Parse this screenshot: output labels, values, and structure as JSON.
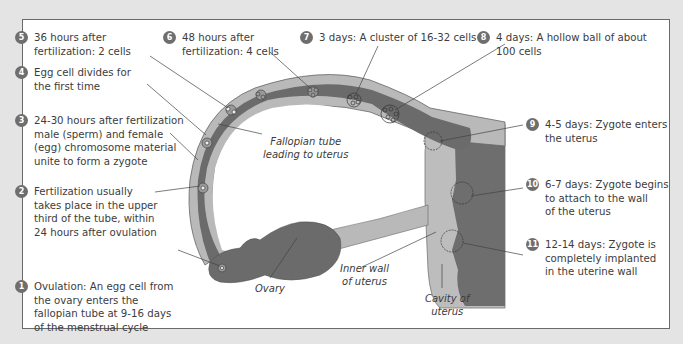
{
  "diagram": {
    "colors": {
      "background": "#e4e4e4",
      "panel": "#ffffff",
      "tube_outer": "#b9b9b9",
      "tube_inner": "#6b6b6b",
      "uterus_wall": "#bdbdbd",
      "uterus_cavity": "#6e6e6e",
      "badge": "#6e6e6e"
    },
    "steps": [
      {
        "num": "1",
        "text": "Ovulation: An egg cell from\nthe ovary enters the\nfallopian tube at 9-16 days\nof the menstrual cycle"
      },
      {
        "num": "2",
        "text": "Fertilization usually\ntakes place in the upper\nthird of the tube, within\n24 hours after ovulation"
      },
      {
        "num": "3",
        "text": "24-30 hours after fertilization\nmale (sperm) and female\n(egg) chromosome material\nunite to form a zygote"
      },
      {
        "num": "4",
        "text": "Egg cell divides for\nthe first time"
      },
      {
        "num": "5",
        "text": "36 hours after\nfertilization: 2 cells"
      },
      {
        "num": "6",
        "text": "48 hours after\nfertilization: 4 cells"
      },
      {
        "num": "7",
        "text": "3 days: A cluster of 16-32 cells"
      },
      {
        "num": "8",
        "text": "4 days: A hollow ball of about\n100 cells"
      },
      {
        "num": "9",
        "text": "4-5 days: Zygote enters\nthe uterus"
      },
      {
        "num": "10",
        "text": "6-7 days: Zygote begins\nto attach to the wall\nof the uterus"
      },
      {
        "num": "11",
        "text": "12-14 days: Zygote is\ncompletely implanted\nin the uterine wall"
      }
    ],
    "labels": {
      "fallopian": "Fallopian tube\nleading to uterus",
      "ovary": "Ovary",
      "inner_wall": "Inner wall\nof uterus",
      "cavity": "Cavity of\nuterus"
    }
  }
}
